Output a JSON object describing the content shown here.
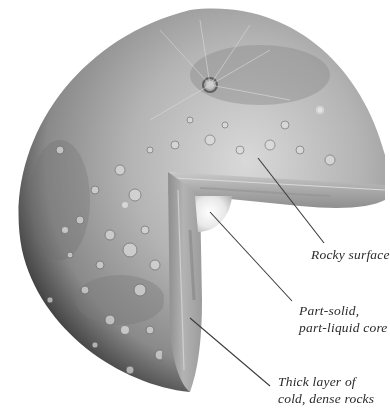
{
  "diagram": {
    "colors": {
      "background": "#ffffff",
      "surface_light": "#cfcfcf",
      "surface_mid": "#9a9a9a",
      "surface_dark": "#3a3a3a",
      "slab": "#b8b8b8",
      "core": "#f4f4f4",
      "leader_line": "#3c3c3c",
      "label_text": "#2a2a2a"
    },
    "labels": [
      {
        "id": "rocky-surface",
        "lines": [
          "Rocky surface"
        ]
      },
      {
        "id": "core",
        "lines": [
          "Part-solid,",
          "part-liquid core"
        ]
      },
      {
        "id": "mantle",
        "lines": [
          "Thick layer of",
          "cold, dense rocks"
        ]
      }
    ]
  }
}
